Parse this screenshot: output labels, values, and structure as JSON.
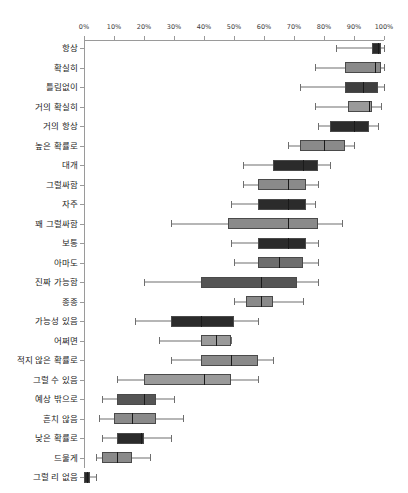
{
  "chart_data": {
    "type": "box",
    "title": "",
    "xlabel": "",
    "ylabel": "",
    "xlim": [
      0,
      100
    ],
    "grid": false,
    "legend": null,
    "x_tick_labels": [
      "0%",
      "10%",
      "20%",
      "30%",
      "40%",
      "50%",
      "60%",
      "70%",
      "80%",
      "90%",
      "100%"
    ],
    "x_tick_values": [
      0,
      10,
      20,
      30,
      40,
      50,
      60,
      70,
      80,
      90,
      100
    ],
    "categories": [
      "항상",
      "확실히",
      "틀림없이",
      "거의 확실히",
      "거의 항상",
      "높은 확률로",
      "대개",
      "그럴싸함",
      "자주",
      "꽤 그럴싸함",
      "보통",
      "아마도",
      "진짜 가능함",
      "종종",
      "가능성 있음",
      "어쩌면",
      "적지 않은 확률로",
      "그럴 수 있음",
      "예상 밖으로",
      "흔치 않음",
      "낮은 확률로",
      "드물게",
      "그럴 리 없음"
    ],
    "boxes": [
      {
        "label": "항상",
        "whisker_low": 84,
        "q1": 96,
        "median": 98,
        "q3": 99,
        "whisker_high": 100,
        "fill": "#2b2b2b"
      },
      {
        "label": "확실히",
        "whisker_low": 77,
        "q1": 87,
        "median": 97,
        "q3": 99,
        "whisker_high": 100,
        "fill": "#8a8a8a"
      },
      {
        "label": "틀림없이",
        "whisker_low": 72,
        "q1": 87,
        "median": 93,
        "q3": 98,
        "whisker_high": 100,
        "fill": "#3f3f3f"
      },
      {
        "label": "거의 확실히",
        "whisker_low": 77,
        "q1": 88,
        "median": 95,
        "q3": 96,
        "whisker_high": 99,
        "fill": "#9a9a9a"
      },
      {
        "label": "거의 항상",
        "whisker_low": 78,
        "q1": 82,
        "median": 90,
        "q3": 95,
        "whisker_high": 98,
        "fill": "#2b2b2b"
      },
      {
        "label": "높은 확률로",
        "whisker_low": 68,
        "q1": 72,
        "median": 80,
        "q3": 87,
        "whisker_high": 90,
        "fill": "#8a8a8a"
      },
      {
        "label": "대개",
        "whisker_low": 53,
        "q1": 63,
        "median": 73,
        "q3": 78,
        "whisker_high": 82,
        "fill": "#2b2b2b"
      },
      {
        "label": "그럴싸함",
        "whisker_low": 53,
        "q1": 58,
        "median": 68,
        "q3": 74,
        "whisker_high": 78,
        "fill": "#8a8a8a"
      },
      {
        "label": "자주",
        "whisker_low": 49,
        "q1": 58,
        "median": 68,
        "q3": 74,
        "whisker_high": 77,
        "fill": "#2b2b2b"
      },
      {
        "label": "꽤 그럴싸함",
        "whisker_low": 29,
        "q1": 48,
        "median": 68,
        "q3": 78,
        "whisker_high": 86,
        "fill": "#8a8a8a"
      },
      {
        "label": "보통",
        "whisker_low": 49,
        "q1": 58,
        "median": 68,
        "q3": 74,
        "whisker_high": 78,
        "fill": "#2b2b2b"
      },
      {
        "label": "아마도",
        "whisker_low": 50,
        "q1": 58,
        "median": 65,
        "q3": 73,
        "whisker_high": 78,
        "fill": "#6e6e6e"
      },
      {
        "label": "진짜 가능함",
        "whisker_low": 20,
        "q1": 39,
        "median": 59,
        "q3": 71,
        "whisker_high": 78,
        "fill": "#555555"
      },
      {
        "label": "종종",
        "whisker_low": 50,
        "q1": 54,
        "median": 59,
        "q3": 63,
        "whisker_high": 73,
        "fill": "#8a8a8a"
      },
      {
        "label": "가능성 있음",
        "whisker_low": 17,
        "q1": 29,
        "median": 39,
        "q3": 50,
        "whisker_high": 58,
        "fill": "#2b2b2b"
      },
      {
        "label": "어쩌면",
        "whisker_low": 25,
        "q1": 39,
        "median": 44,
        "q3": 49,
        "whisker_high": 49,
        "fill": "#9a9a9a"
      },
      {
        "label": "적지 않은 확률로",
        "whisker_low": 29,
        "q1": 39,
        "median": 49,
        "q3": 58,
        "whisker_high": 63,
        "fill": "#8a8a8a"
      },
      {
        "label": "그럴 수 있음",
        "whisker_low": 11,
        "q1": 20,
        "median": 40,
        "q3": 49,
        "whisker_high": 58,
        "fill": "#9a9a9a"
      },
      {
        "label": "예상 밖으로",
        "whisker_low": 6,
        "q1": 11,
        "median": 20,
        "q3": 24,
        "whisker_high": 30,
        "fill": "#555555"
      },
      {
        "label": "흔치 않음",
        "whisker_low": 5,
        "q1": 10,
        "median": 16,
        "q3": 24,
        "whisker_high": 33,
        "fill": "#8a8a8a"
      },
      {
        "label": "낮은 확률로",
        "whisker_low": 6,
        "q1": 11,
        "median": 19,
        "q3": 20,
        "whisker_high": 29,
        "fill": "#2b2b2b"
      },
      {
        "label": "드물게",
        "whisker_low": 4,
        "q1": 6,
        "median": 11,
        "q3": 16,
        "whisker_high": 22,
        "fill": "#8a8a8a"
      },
      {
        "label": "그럴 리 없음",
        "whisker_low": 0,
        "q1": 0,
        "median": 1,
        "q3": 2,
        "whisker_high": 4,
        "fill": "#2b2b2b"
      }
    ]
  }
}
